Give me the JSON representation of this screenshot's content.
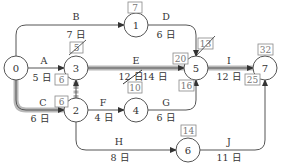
{
  "diagram": {
    "type": "arrow-network (PERT/CPM)",
    "colors": {
      "line": "#555555",
      "critical": "#9a9a9a",
      "node_stroke": "#555555",
      "box": "#888888"
    },
    "nodes": [
      {
        "id": "0",
        "label": "0",
        "x": 16,
        "y": 68
      },
      {
        "id": "1",
        "label": "1",
        "x": 136,
        "y": 25
      },
      {
        "id": "3",
        "label": "3",
        "x": 76,
        "y": 68
      },
      {
        "id": "5",
        "label": "5",
        "x": 196,
        "y": 68
      },
      {
        "id": "7",
        "label": "7",
        "x": 265,
        "y": 68
      },
      {
        "id": "2",
        "label": "2",
        "x": 76,
        "y": 110
      },
      {
        "id": "4",
        "label": "4",
        "x": 136,
        "y": 110
      },
      {
        "id": "6",
        "label": "6",
        "x": 188,
        "y": 150
      }
    ],
    "activities": [
      {
        "name": "A",
        "from": "0",
        "to": "3",
        "duration": "5 日",
        "critical": false
      },
      {
        "name": "B",
        "from": "0",
        "to": "1",
        "duration": "7 日",
        "critical": false
      },
      {
        "name": "C",
        "from": "0",
        "to": "2",
        "duration": "6 日",
        "critical": true
      },
      {
        "name": "D",
        "from": "1",
        "to": "5",
        "duration": "6 日",
        "critical": false
      },
      {
        "name": "E",
        "from": "3",
        "to": "5",
        "duration": "12 日",
        "duration_corrected": "14 日",
        "critical": true
      },
      {
        "name": "F",
        "from": "2",
        "to": "4",
        "duration": "4 日",
        "critical": false
      },
      {
        "name": "G",
        "from": "4",
        "to": "5",
        "duration": "6 日",
        "critical": false
      },
      {
        "name": "H",
        "from": "2",
        "to": "6",
        "duration": "8 日",
        "critical": false
      },
      {
        "name": "I",
        "from": "5",
        "to": "7",
        "duration": "12 日",
        "critical": true
      },
      {
        "name": "J",
        "from": "6",
        "to": "7",
        "duration": "11 日",
        "critical": false
      },
      {
        "name": "dummy",
        "from": "2",
        "to": "3",
        "duration": "",
        "critical": true
      }
    ],
    "boxes": [
      {
        "id": "box-1",
        "text": "7",
        "near": "1",
        "struck": false
      },
      {
        "id": "box-3-top",
        "text": "5",
        "near": "3",
        "struck": true
      },
      {
        "id": "box-A",
        "text": "6",
        "near": "3",
        "struck": false
      },
      {
        "id": "box-C",
        "text": "6",
        "near": "2",
        "struck": false
      },
      {
        "id": "box-4",
        "text": "10",
        "near": "4",
        "struck": false
      },
      {
        "id": "box-5-left",
        "text": "20",
        "near": "5",
        "struck": false
      },
      {
        "id": "box-5-top",
        "text": "13",
        "near": "5",
        "struck": true
      },
      {
        "id": "box-5-below",
        "text": "16",
        "near": "5",
        "struck": false
      },
      {
        "id": "box-6",
        "text": "14",
        "near": "6",
        "struck": false
      },
      {
        "id": "box-7-top",
        "text": "32",
        "near": "7",
        "struck": false
      },
      {
        "id": "box-7-bottom",
        "text": "25",
        "near": "7",
        "struck": false
      }
    ]
  },
  "labels": {
    "n0": "0",
    "n1": "1",
    "n2": "2",
    "n3": "3",
    "n4": "4",
    "n5": "5",
    "n6": "6",
    "n7": "7",
    "A": "A",
    "A_d": "5 日",
    "B": "B",
    "B_d": "7 日",
    "C": "C",
    "C_d": "6 日",
    "D": "D",
    "D_d": "6 日",
    "E": "E",
    "E_d": "12 日",
    "E_d2": "14 日",
    "F": "F",
    "F_d": "4 日",
    "G": "G",
    "G_d": "6 日",
    "H": "H",
    "H_d": "8 日",
    "I": "I",
    "I_d": "12 日",
    "J": "J",
    "J_d": "11 日",
    "b1": "7",
    "b3": "5",
    "bA": "6",
    "bC": "6",
    "b4": "10",
    "b5l": "20",
    "b5t": "13",
    "b5b": "16",
    "b6": "14",
    "b7t": "32",
    "b7b": "25"
  }
}
